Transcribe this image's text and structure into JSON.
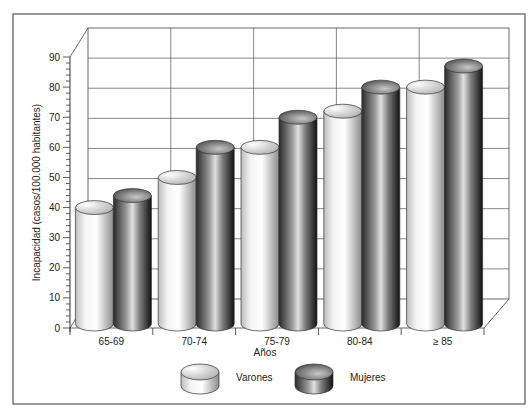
{
  "chart_data": {
    "type": "bar",
    "style": "3d-cylinder",
    "title": "",
    "xlabel": "Años",
    "ylabel": "Incapacidad (casos/100.000 habitantes)",
    "categories": [
      "65-69",
      "70-74",
      "75-79",
      "80-84",
      "≥ 85"
    ],
    "series": [
      {
        "name": "Varones",
        "color": "#d8d8d8",
        "values": [
          38,
          48,
          58,
          70,
          78
        ]
      },
      {
        "name": "Mujeres",
        "color": "#555555",
        "values": [
          42,
          58,
          68,
          78,
          85
        ]
      }
    ],
    "ylim": [
      0,
      90
    ],
    "yticks": [
      0,
      10,
      20,
      30,
      40,
      50,
      60,
      70,
      80,
      90
    ],
    "grid": true,
    "legend_position": "bottom"
  },
  "legend": {
    "items": [
      {
        "label": "Varones"
      },
      {
        "label": "Mujeres"
      }
    ]
  }
}
